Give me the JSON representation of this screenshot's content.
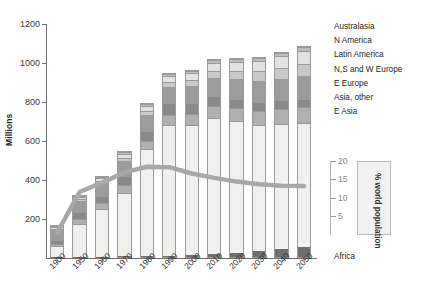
{
  "chart_data": {
    "type": "bar",
    "stacked": true,
    "title": "",
    "xlabel": "",
    "ylabel": "Millions",
    "ylim": [
      0,
      1200
    ],
    "yticks": [
      200,
      400,
      600,
      800,
      1000,
      1200
    ],
    "grid": false,
    "legend_position": "right",
    "categories": [
      "1900",
      "1950",
      "1960",
      "1970",
      "1980",
      "1990",
      "2000",
      "2010",
      "2020",
      "2030",
      "2040",
      "2050"
    ],
    "series": [
      {
        "name": "Africa",
        "color": "#6e6e6e",
        "values": [
          1,
          2,
          2,
          3,
          4,
          6,
          9,
          14,
          21,
          30,
          40,
          52
        ]
      },
      {
        "name": "E Asia",
        "color": "#f0f0ef",
        "values": [
          60,
          175,
          250,
          330,
          555,
          680,
          675,
          705,
          685,
          655,
          650,
          640
        ]
      },
      {
        "name": "Asia, other",
        "color": "#b0b0b0",
        "values": [
          12,
          25,
          30,
          42,
          45,
          52,
          58,
          62,
          65,
          72,
          78,
          85
        ]
      },
      {
        "name": "E Europe",
        "color": "#8a8a8a",
        "values": [
          20,
          35,
          40,
          48,
          52,
          58,
          55,
          52,
          50,
          48,
          45,
          42
        ]
      },
      {
        "name": "N,S and W Europe",
        "color": "#9c9c9c",
        "values": [
          55,
          60,
          65,
          78,
          82,
          88,
          90,
          95,
          100,
          105,
          110,
          118
        ]
      },
      {
        "name": "Latin America",
        "color": "#c9c9c9",
        "values": [
          8,
          10,
          12,
          18,
          22,
          26,
          32,
          38,
          45,
          52,
          58,
          65
        ]
      },
      {
        "name": "N America",
        "color": "#e2e2e2",
        "values": [
          10,
          12,
          15,
          22,
          26,
          30,
          35,
          40,
          46,
          52,
          58,
          64
        ]
      },
      {
        "name": "Australasia",
        "color": "#bdbdbd",
        "values": [
          4,
          5,
          6,
          8,
          9,
          10,
          12,
          14,
          16,
          18,
          20,
          22
        ]
      }
    ],
    "secondary_axis": {
      "label": "% world population",
      "ticks": [
        5,
        10,
        15,
        20
      ],
      "lim": [
        0,
        20
      ],
      "color": "#a8a8a8",
      "series_name": "% world population",
      "values": [
        0.5,
        11.5,
        14.0,
        16.8,
        18.3,
        18.2,
        16.5,
        15.3,
        14.3,
        13.6,
        13.2,
        13.1
      ]
    }
  },
  "legend": {
    "items": [
      {
        "label": "Australasia"
      },
      {
        "label": "N America"
      },
      {
        "label": "Latin America"
      },
      {
        "label": "N,S and W Europe"
      },
      {
        "label": "E Europe"
      },
      {
        "label": "Asia, other"
      },
      {
        "label": "E Asia"
      },
      {
        "label": "Africa"
      }
    ]
  }
}
